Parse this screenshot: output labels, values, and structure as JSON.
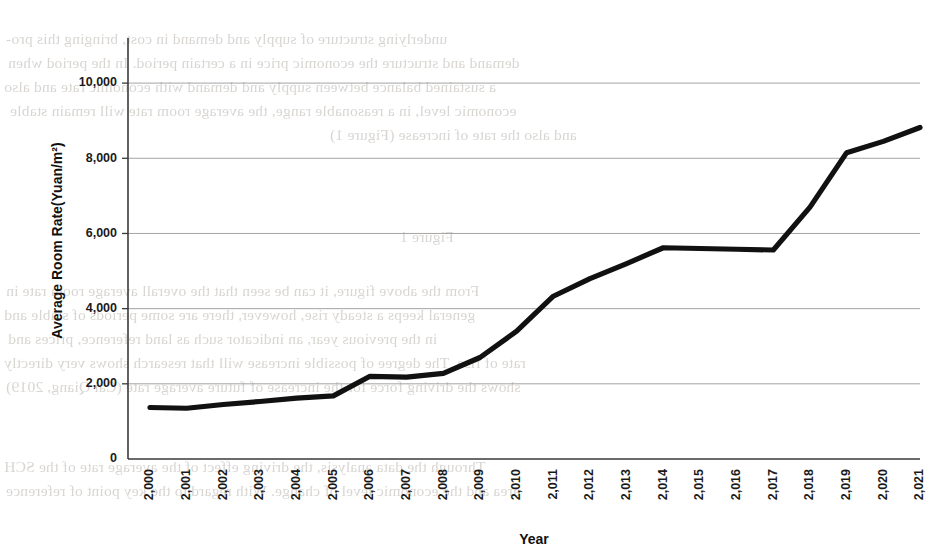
{
  "chart_data": {
    "type": "line",
    "title": "",
    "xlabel": "Year",
    "ylabel": "Average Room Rate(Yuan/m²)",
    "x": [
      2000,
      2001,
      2002,
      2003,
      2004,
      2005,
      2006,
      2007,
      2008,
      2009,
      2010,
      2011,
      2012,
      2013,
      2014,
      2015,
      2016,
      2017,
      2018,
      2019,
      2020,
      2021
    ],
    "xtick_labels": [
      "2,000",
      "2,001",
      "2,002",
      "2,003",
      "2,004",
      "2,005",
      "2,006",
      "2,007",
      "2,008",
      "2,009",
      "2,010",
      "2,011",
      "2,012",
      "2,013",
      "2,014",
      "2,015",
      "2,016",
      "2,017",
      "2,018",
      "2,019",
      "2,020",
      "2,021"
    ],
    "values": [
      1370,
      1350,
      1450,
      1530,
      1620,
      1680,
      2200,
      2180,
      2280,
      2700,
      3400,
      4330,
      4800,
      5200,
      5620,
      5600,
      5580,
      5560,
      6700,
      8150,
      8450,
      8820
    ],
    "ytick_labels": [
      "0",
      "2,000",
      "4,000",
      "6,000",
      "8,000",
      "10,000"
    ],
    "ytick_values": [
      0,
      2000,
      4000,
      6000,
      8000,
      10000
    ],
    "ylim": [
      0,
      11200
    ],
    "xlim": [
      2000,
      2021
    ],
    "grid": "horizontal",
    "legend": "none",
    "series_color": "#111111",
    "grid_color": "#9a9a9a",
    "axis_color": "#3a3a3a"
  },
  "scan_bleed": {
    "note": "faint mirrored show-through text from reverse side of scanned page",
    "lines": [
      "underlying structure of supply and demand in cost, bringing this pro-",
      "demand and structure the economic price in a certain period. In the period when",
      "a sustained balance between supply and demand with economic rate and also",
      "economic level, in a reasonable range, the average room rate will remain stable",
      "and also the rate of increase (Figure 1)",
      "Figure 1",
      "From the above figure, it can be seen that the overall average room rate in",
      "general keeps a steady rise, however, there are some periods of stable and",
      "in the previous year, an indicator such as land reference, prices and",
      "rate of rise. The degree of possible increase will that research shows very directly",
      "shows the driving force for the increase of future average rate (Cai Qiang, 2019)",
      "Through the data analysis, the driving effect of the average rate of the SCH",
      "area and the economic level of change. With regard to the key point of reference"
    ]
  }
}
